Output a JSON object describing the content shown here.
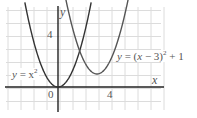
{
  "chart_data": {
    "type": "line",
    "title": "",
    "xlabel": "x",
    "ylabel": "y",
    "xlim": [
      -4,
      8
    ],
    "ylim": [
      -1.8,
      6.2
    ],
    "grid": true,
    "grid_step": 1,
    "x_ticks": [
      {
        "value": 0,
        "label": "0"
      },
      {
        "value": 4,
        "label": "4"
      }
    ],
    "y_ticks": [
      {
        "value": 4,
        "label": "4"
      }
    ],
    "series": [
      {
        "name": "y = x^2",
        "label": "y = x²",
        "expression": "x^2",
        "vertex": [
          0,
          0
        ],
        "color": "#333333"
      },
      {
        "name": "y = (x - 3)^2 + 1",
        "label": "y = (x − 3)² + 1",
        "expression": "(x-3)^2+1",
        "vertex": [
          3,
          1
        ],
        "color": "#555555"
      }
    ],
    "annotations": [
      {
        "text": "y = x²",
        "near": [
          -3,
          1.2
        ]
      },
      {
        "text": "y = (x − 3)² + 1",
        "near": [
          6.5,
          2.8
        ]
      }
    ]
  },
  "labels": {
    "x_axis": "x",
    "y_axis": "y",
    "origin": "0",
    "x_tick_4": "4",
    "y_tick_4": "4",
    "curve1_y": "y",
    "curve1_eq": " = x",
    "curve1_exp": "2",
    "curve2_y": "y",
    "curve2_eq": " = (",
    "curve2_x": "x",
    "curve2_rest": " − 3)",
    "curve2_exp": "2",
    "curve2_tail": " + 1"
  }
}
